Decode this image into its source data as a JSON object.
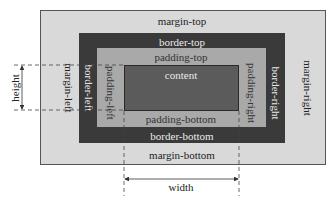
{
  "diagram": {
    "colors": {
      "margin": "#d9d9d9",
      "border": "#3a3a3a",
      "padding": "#a9a9a9",
      "content": "#5b5b5b"
    },
    "labels": {
      "margin_top": "margin-top",
      "margin_bottom": "margin-bottom",
      "margin_left": "margin-left",
      "margin_right": "margin-right",
      "border_top": "border-top",
      "border_bottom": "border-bottom",
      "border_left": "border-left",
      "border_right": "border-right",
      "padding_top": "padding-top",
      "padding_bottom": "padding-bottom",
      "padding_left": "padding-left",
      "padding_right": "padding-right",
      "content": "content",
      "height": "height",
      "width": "width"
    }
  }
}
